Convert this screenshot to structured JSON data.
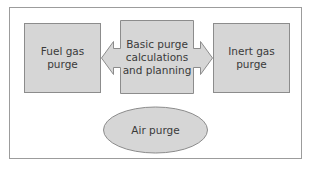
{
  "diagram": {
    "nodes": [
      {
        "id": "fuel-gas-purge",
        "label_line1": "Fuel gas",
        "label_line2": "purge",
        "shape": "rectangle"
      },
      {
        "id": "basic-purge",
        "label_line1": "Basic purge",
        "label_line2": "calculations",
        "label_line3": "and planning",
        "shape": "rectangle-with-double-arrow"
      },
      {
        "id": "inert-gas-purge",
        "label_line1": "Inert gas",
        "label_line2": "purge",
        "shape": "rectangle"
      },
      {
        "id": "air-purge",
        "label_line1": "Air purge",
        "shape": "ellipse"
      }
    ],
    "edges": [
      {
        "from": "basic-purge",
        "to": "fuel-gas-purge",
        "style": "block-arrow-left"
      },
      {
        "from": "basic-purge",
        "to": "inert-gas-purge",
        "style": "block-arrow-right"
      }
    ],
    "colors": {
      "node_fill": "#d6d6d6",
      "node_stroke": "#8c8c8c",
      "frame_stroke": "#9c9c9c",
      "text": "#3a3a3a"
    }
  }
}
